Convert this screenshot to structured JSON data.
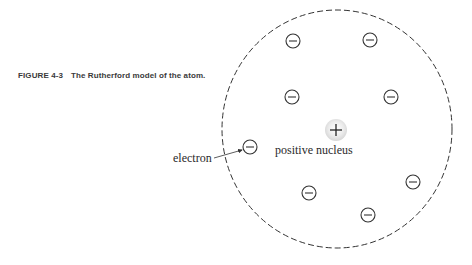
{
  "caption": {
    "figure_number": "FIGURE 4-3",
    "text": "The Rutherford model of the atom."
  },
  "diagram": {
    "title": "The Rutherford model of the atom",
    "atom_boundary": {
      "cx": 337,
      "cy": 129,
      "rx": 115,
      "ry": 119,
      "style": "dashed"
    },
    "nucleus": {
      "label": "positive nucleus",
      "symbol": "+",
      "x": 336,
      "y": 130
    },
    "electron_label": "electron",
    "electron_symbol": "−",
    "electrons": [
      {
        "x": 293,
        "y": 41
      },
      {
        "x": 370,
        "y": 40
      },
      {
        "x": 292,
        "y": 97
      },
      {
        "x": 391,
        "y": 97
      },
      {
        "x": 250,
        "y": 147
      },
      {
        "x": 309,
        "y": 193
      },
      {
        "x": 413,
        "y": 182
      },
      {
        "x": 368,
        "y": 215
      }
    ]
  }
}
